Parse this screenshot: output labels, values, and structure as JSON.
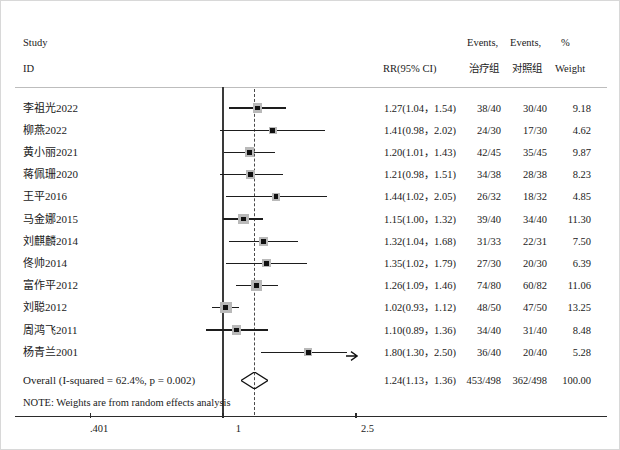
{
  "figure": {
    "type": "forest-plot",
    "title_col1": "Study",
    "title_col1b": "ID",
    "header": {
      "effect": "RR(95% CI)",
      "events_top_1": "Events,",
      "events_top_2": "Events,",
      "pct": "%",
      "events_sub_1": "治疗组",
      "events_sub_2": "对照组",
      "weight": "Weight"
    },
    "note": "NOTE: Weights are from random effects analysis",
    "overall_label": "Overall (I-squared = 62.4%,  p = 0.002)"
  },
  "chart_data": {
    "type": "forest",
    "title": "",
    "xlabel": "",
    "ylabel": "",
    "scale": "log",
    "xlim": [
      0.401,
      2.5
    ],
    "ticks": [
      ".401",
      "1",
      "2.5"
    ],
    "tick_values": [
      0.401,
      1,
      2.5
    ],
    "reference_line": 1,
    "pooled_line": 1.24,
    "grid": false,
    "legend": "none",
    "columns": [
      "Study ID",
      "RR(95% CI)",
      "Events, 治疗组",
      "Events, 对照组",
      "% Weight"
    ],
    "rows": [
      {
        "study": "李祖光2022",
        "rr": 1.27,
        "lo": 1.04,
        "hi": 1.54,
        "effect": "1.27(1.04，1.54)",
        "ev_t": "38/40",
        "ev_c": "30/40",
        "weight": 9.18,
        "weight_label": "9.18",
        "truncated": false
      },
      {
        "study": "柳燕2022",
        "rr": 1.41,
        "lo": 0.98,
        "hi": 2.02,
        "effect": "1.41(0.98，2.02)",
        "ev_t": "24/30",
        "ev_c": "17/30",
        "weight": 4.62,
        "weight_label": "4.62",
        "truncated": false
      },
      {
        "study": "黄小丽2021",
        "rr": 1.2,
        "lo": 1.01,
        "hi": 1.43,
        "effect": "1.20(1.01，1.43)",
        "ev_t": "42/45",
        "ev_c": "35/45",
        "weight": 9.87,
        "weight_label": "9.87",
        "truncated": false
      },
      {
        "study": "蒋佩珊2020",
        "rr": 1.21,
        "lo": 0.98,
        "hi": 1.51,
        "effect": "1.21(0.98，1.51)",
        "ev_t": "34/38",
        "ev_c": "28/38",
        "weight": 8.23,
        "weight_label": "8.23",
        "truncated": false
      },
      {
        "study": "王平2016",
        "rr": 1.44,
        "lo": 1.02,
        "hi": 2.05,
        "effect": "1.44(1.02，2.05)",
        "ev_t": "26/32",
        "ev_c": "18/32",
        "weight": 4.85,
        "weight_label": "4.85",
        "truncated": false
      },
      {
        "study": "马金娜2015",
        "rr": 1.15,
        "lo": 1.0,
        "hi": 1.32,
        "effect": "1.15(1.00，1.32)",
        "ev_t": "39/40",
        "ev_c": "34/40",
        "weight": 11.3,
        "weight_label": "11.30",
        "truncated": false
      },
      {
        "study": "刘麒麟2014",
        "rr": 1.32,
        "lo": 1.04,
        "hi": 1.68,
        "effect": "1.32(1.04，1.68)",
        "ev_t": "31/33",
        "ev_c": "22/31",
        "weight": 7.5,
        "weight_label": "7.50",
        "truncated": false
      },
      {
        "study": "佟帅2014",
        "rr": 1.35,
        "lo": 1.02,
        "hi": 1.79,
        "effect": "1.35(1.02，1.79)",
        "ev_t": "27/30",
        "ev_c": "20/30",
        "weight": 6.39,
        "weight_label": "6.39",
        "truncated": false
      },
      {
        "study": "富作平2012",
        "rr": 1.26,
        "lo": 1.09,
        "hi": 1.46,
        "effect": "1.26(1.09，1.46)",
        "ev_t": "74/80",
        "ev_c": "60/82",
        "weight": 11.06,
        "weight_label": "11.06",
        "truncated": false
      },
      {
        "study": "刘聪2012",
        "rr": 1.02,
        "lo": 0.93,
        "hi": 1.12,
        "effect": "1.02(0.93，1.12)",
        "ev_t": "48/50",
        "ev_c": "47/50",
        "weight": 13.25,
        "weight_label": "13.25",
        "truncated": false
      },
      {
        "study": "周鸿飞2011",
        "rr": 1.1,
        "lo": 0.89,
        "hi": 1.36,
        "effect": "1.10(0.89，1.36)",
        "ev_t": "34/40",
        "ev_c": "31/40",
        "weight": 8.48,
        "weight_label": "8.48",
        "truncated": false
      },
      {
        "study": "杨青兰2001",
        "rr": 1.8,
        "lo": 1.3,
        "hi": 2.5,
        "effect": "1.80(1.30，2.50)",
        "ev_t": "36/40",
        "ev_c": "20/40",
        "weight": 5.28,
        "weight_label": "5.28",
        "truncated": true
      }
    ],
    "overall": {
      "study": "Overall (I-squared = 62.4%,  p = 0.002)",
      "rr": 1.24,
      "lo": 1.13,
      "hi": 1.36,
      "effect": "1.24(1.13，1.36)",
      "ev_t": "453/498",
      "ev_c": "362/498",
      "weight_label": "100.00"
    }
  }
}
